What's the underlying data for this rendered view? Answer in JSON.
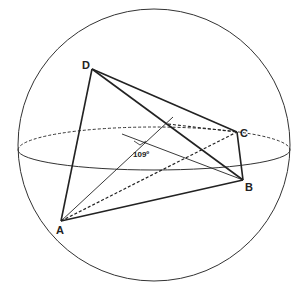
{
  "diagram": {
    "type": "tetrahedron inscribed in sphere",
    "vertices": [
      {
        "label": "A",
        "x": 61,
        "y": 221
      },
      {
        "label": "B",
        "x": 243,
        "y": 180
      },
      {
        "label": "C",
        "x": 237,
        "y": 132
      },
      {
        "label": "D",
        "x": 92,
        "y": 69
      }
    ],
    "angle_label": "109º"
  }
}
